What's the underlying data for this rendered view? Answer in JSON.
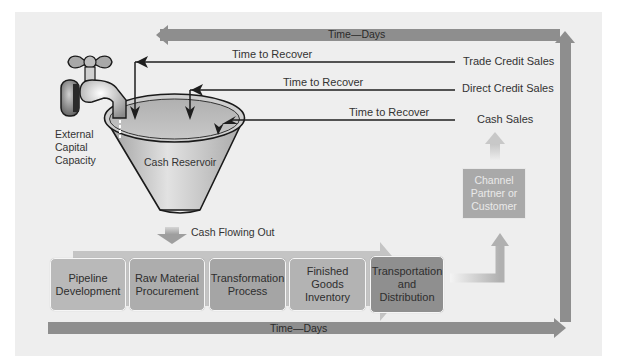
{
  "diagram": {
    "top_axis": {
      "label": "Time—Days",
      "direction": "right-to-left"
    },
    "bottom_axis": {
      "label": "Time—Days",
      "direction": "left-to-right"
    },
    "external_capital": {
      "label": "External\nCapital\nCapacity",
      "icon": "faucet-icon"
    },
    "reservoir": {
      "label": "Cash Reservoir",
      "icon": "funnel-icon"
    },
    "cash_out": {
      "label": "Cash Flowing Out"
    },
    "recovery_lines": [
      {
        "source": "Trade Credit Sales",
        "label": "Time to Recover"
      },
      {
        "source": "Direct Credit Sales",
        "label": "Time to Recover"
      },
      {
        "source": "Cash Sales",
        "label": "Time to Recover"
      }
    ],
    "stages": [
      {
        "label": "Pipeline\nDevelopment",
        "color": "#b9b9b9"
      },
      {
        "label": "Raw Material\nProcurement",
        "color": "#adadad"
      },
      {
        "label": "Transformation\nProcess",
        "color": "#a5a5a5"
      },
      {
        "label": "Finished Goods\nInventory",
        "color": "#b3b3b3"
      },
      {
        "label": "Transportation\nand\nDistribution",
        "color": "#8f8f8f"
      }
    ],
    "channel_partner": {
      "label": "Channel\nPartner or\nCustomer"
    },
    "colors": {
      "panel": "#eeeeee",
      "axis_arrow": "#8e8e8e",
      "process_arrow": "#c4c4c4",
      "line": "#1e1e1e"
    }
  }
}
